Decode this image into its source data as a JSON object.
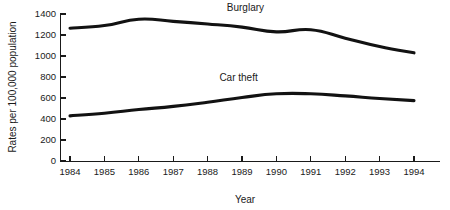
{
  "chart_data": {
    "type": "line",
    "title": "",
    "xlabel": "Year",
    "ylabel": "Rates per 100,000 population",
    "x": [
      1984,
      1985,
      1986,
      1987,
      1988,
      1989,
      1990,
      1991,
      1992,
      1993,
      1994
    ],
    "xtick_labels": [
      "1984",
      "1985",
      "1986",
      "1987",
      "1988",
      "1989",
      "1990",
      "1991",
      "1992",
      "1993",
      "1994"
    ],
    "ytick_labels": [
      "0",
      "200",
      "400",
      "600",
      "800",
      "1000",
      "1200",
      "1400"
    ],
    "yticks": [
      0,
      200,
      400,
      600,
      800,
      1000,
      1200,
      1400
    ],
    "ylim": [
      0,
      1400
    ],
    "xlim": [
      1984,
      1994
    ],
    "grid": false,
    "legend_position": "inline-annotation",
    "series": [
      {
        "name": "Burglary",
        "color": "#121212",
        "values": [
          1265,
          1290,
          1350,
          1330,
          1305,
          1275,
          1230,
          1250,
          1170,
          1090,
          1030
        ],
        "label_x": 1989.1,
        "label_y": 1430
      },
      {
        "name": "Car theft",
        "color": "#121212",
        "values": [
          430,
          455,
          490,
          520,
          560,
          605,
          640,
          640,
          620,
          595,
          575
        ],
        "label_x": 1988.9,
        "label_y": 760
      }
    ]
  },
  "axes": {
    "y_axis_title": "Rates per 100,000 population",
    "x_axis_title": "Year"
  }
}
